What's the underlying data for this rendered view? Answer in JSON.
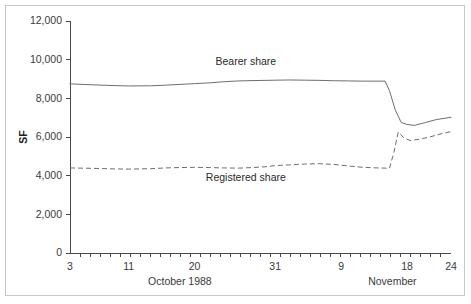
{
  "chart_data": {
    "type": "line",
    "title": "",
    "subtitle": "",
    "xlabel": "",
    "ylabel": "SF",
    "ylim": [
      0,
      12000
    ],
    "grid": false,
    "legend_position": "inline-annotation",
    "y_ticks": [
      "0",
      "2,000",
      "4,000",
      "6,000",
      "8,000",
      "10,000",
      "12,000"
    ],
    "y_tick_values": [
      0,
      2000,
      4000,
      6000,
      8000,
      10000,
      12000
    ],
    "x_tick_labels": [
      "3",
      "11",
      "20",
      "31",
      "9",
      "18",
      "24"
    ],
    "x_tick_values": [
      3,
      11,
      20,
      31,
      40,
      49,
      55
    ],
    "x_minor_tick_count": 37,
    "x_period_labels": [
      {
        "text": "October 1988",
        "at": 18
      },
      {
        "text": "November",
        "at": 47
      }
    ],
    "xlim": [
      3,
      55
    ],
    "series": [
      {
        "name": "Bearer share",
        "style": "solid",
        "annotation": "Bearer share",
        "annotation_x": 27,
        "annotation_y": 9700,
        "x": [
          3,
          6,
          9,
          11,
          14,
          16,
          18,
          20,
          22,
          24,
          26,
          28,
          30,
          31,
          33,
          35,
          37,
          39,
          41,
          43,
          45,
          46,
          46.6,
          47.4,
          48.2,
          49,
          50,
          51.5,
          53,
          55
        ],
        "values": [
          8750,
          8700,
          8660,
          8640,
          8650,
          8680,
          8720,
          8760,
          8800,
          8860,
          8900,
          8920,
          8930,
          8940,
          8950,
          8940,
          8930,
          8910,
          8900,
          8890,
          8890,
          8890,
          8400,
          7400,
          6750,
          6650,
          6600,
          6750,
          6900,
          7020
        ]
      },
      {
        "name": "Registered share",
        "style": "dashed",
        "annotation": "Registered share",
        "annotation_x": 27,
        "annotation_y": 3700,
        "x": [
          3,
          6,
          9,
          11,
          14,
          16,
          18,
          20,
          22,
          24,
          26,
          28,
          30,
          31,
          33,
          35,
          37,
          39,
          41,
          43,
          45,
          46,
          46.6,
          47.2,
          47.8,
          48.6,
          49.4,
          50.5,
          52,
          53.5,
          55
        ],
        "values": [
          4400,
          4380,
          4350,
          4340,
          4360,
          4400,
          4420,
          4430,
          4420,
          4400,
          4390,
          4420,
          4470,
          4520,
          4560,
          4600,
          4620,
          4580,
          4500,
          4430,
          4400,
          4390,
          4380,
          5200,
          6250,
          5950,
          5820,
          5870,
          5990,
          6150,
          6280
        ]
      }
    ]
  }
}
